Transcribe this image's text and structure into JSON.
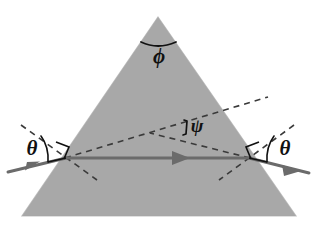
{
  "figure": {
    "background_color": "#ffffff"
  },
  "prism": {
    "name": "triangular-prism",
    "fill_color": "#a8a8a8",
    "apex": {
      "x": 158,
      "y": 17
    },
    "base_left": {
      "x": 22,
      "y": 216
    },
    "base_right": {
      "x": 296,
      "y": 216
    }
  },
  "labels": {
    "apex_angle": "ϕ",
    "deviation_angle": "ψ",
    "incidence_angle_left": "θ",
    "incidence_angle_right": "θ"
  },
  "label_positions": {
    "apex_angle": {
      "x": 159,
      "y": 57
    },
    "deviation_angle": {
      "x": 196,
      "y": 129
    },
    "incidence_angle_left": {
      "x": 32,
      "y": 151
    },
    "incidence_angle_right": {
      "x": 285,
      "y": 151
    }
  },
  "rays": {
    "color": "#6b6b6b",
    "incident": {
      "name": "incident-ray",
      "from": {
        "x": 8,
        "y": 172
      },
      "to": {
        "x": 65,
        "y": 158
      },
      "arrow_at": {
        "x": 32,
        "y": 166
      }
    },
    "internal": {
      "name": "internal-ray",
      "from": {
        "x": 65,
        "y": 158
      },
      "to": {
        "x": 250,
        "y": 158
      },
      "arrow_at": {
        "x": 180,
        "y": 158
      }
    },
    "exit": {
      "name": "exit-ray",
      "from": {
        "x": 250,
        "y": 158
      },
      "to": {
        "x": 309,
        "y": 173
      },
      "arrow_at": {
        "x": 288,
        "y": 168
      }
    }
  },
  "construction_lines": {
    "color": "#3a3a3a",
    "dash_pattern": "6 5",
    "normal_left": {
      "name": "normal-left-face",
      "from": {
        "x": 21,
        "y": 125
      },
      "to": {
        "x": 97,
        "y": 180
      }
    },
    "normal_right": {
      "name": "normal-right-face",
      "from": {
        "x": 294,
        "y": 125
      },
      "to": {
        "x": 219,
        "y": 180
      }
    },
    "incident_extension": {
      "name": "incident-ray-extension",
      "from": {
        "x": 65,
        "y": 158
      },
      "to": {
        "x": 268,
        "y": 97
      }
    },
    "exit_backward_extension": {
      "name": "exit-ray-back-extension",
      "from": {
        "x": 250,
        "y": 158
      },
      "to": {
        "x": 157,
        "y": 135
      }
    }
  },
  "markers": {
    "right_angle_left": {
      "name": "right-angle-marker-left",
      "x": 62,
      "y": 148
    },
    "right_angle_right": {
      "name": "right-angle-marker-right",
      "x": 253,
      "y": 148
    },
    "apex_arc": {
      "name": "apex-angle-arc"
    },
    "theta_arc_left": {
      "name": "theta-arc-left"
    },
    "theta_arc_right": {
      "name": "theta-arc-right"
    },
    "psi_arc": {
      "name": "psi-angle-arc"
    }
  }
}
